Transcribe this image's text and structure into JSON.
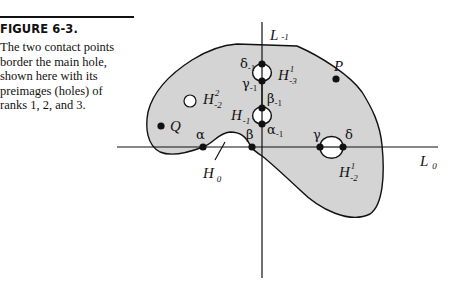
{
  "figure": {
    "number_label": "FIGURE 6-3.",
    "caption_lines": [
      "The two contact points",
      "border the main hole,",
      "shown here with its",
      "preimages (holes) of",
      "ranks 1, 2, and 3."
    ]
  },
  "diagram": {
    "axes": {
      "vertical": {
        "name": "L",
        "sub": "-1"
      },
      "horizontal": {
        "name": "L",
        "sub": "0"
      }
    },
    "points": {
      "P": "P",
      "Q": "Q",
      "alpha": "α",
      "beta": "β",
      "gamma": "γ",
      "delta": "δ",
      "alpha_m1": {
        "sym": "α",
        "sub": "-1"
      },
      "beta_m1": {
        "sym": "β",
        "sub": "-1"
      },
      "gamma_m1": {
        "sym": "γ",
        "sub": "-1"
      },
      "delta_m1": {
        "sym": "δ",
        "sub": "-1"
      }
    },
    "holes": {
      "H0": {
        "name": "H",
        "sub": "0"
      },
      "H_m1": {
        "name": "H",
        "sub": "-1"
      },
      "H1_m2": {
        "name": "H",
        "sup": "1",
        "sub": "-2"
      },
      "H2_m2": {
        "name": "H",
        "sup": "2",
        "sub": "-2"
      },
      "H1_m3": {
        "name": "H",
        "sup": "1",
        "sub": "-3"
      }
    },
    "colors": {
      "region_fill": "#d4d4d4",
      "stroke": "#111111",
      "hole_fill": "#ffffff"
    }
  }
}
